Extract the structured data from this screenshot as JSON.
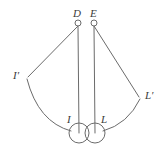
{
  "figure": {
    "type": "geometry-diagram",
    "background_color": "#ffffff",
    "stroke_color": "#6b6b6b",
    "label_color": "#3a3a3a",
    "stroke_width": 1,
    "width": 168,
    "height": 147,
    "labels": {
      "top_left": "D",
      "top_right": "E",
      "far_left": "I′",
      "far_right": "L′",
      "bottom_left": "I",
      "bottom_right": "L"
    },
    "nodes": [
      {
        "id": "D",
        "label": "D",
        "x": 78,
        "y": 23,
        "radius": 3,
        "kind": "open-circle"
      },
      {
        "id": "E",
        "label": "E",
        "x": 94,
        "y": 23,
        "radius": 3,
        "kind": "open-circle"
      },
      {
        "id": "I",
        "label": "I",
        "x": 79,
        "y": 133,
        "radius": 10,
        "kind": "open-circle"
      },
      {
        "id": "L",
        "label": "L",
        "x": 95,
        "y": 133,
        "radius": 10,
        "kind": "open-circle"
      },
      {
        "id": "Iprime",
        "label": "I′",
        "x": 27,
        "y": 78,
        "radius": 0,
        "kind": "vertex"
      },
      {
        "id": "Lprime",
        "label": "L′",
        "x": 140,
        "y": 98,
        "radius": 0,
        "kind": "vertex"
      }
    ],
    "segments": [
      {
        "id": "D-to-Iprime",
        "from": "D",
        "to": "Iprime"
      },
      {
        "id": "E-to-Lprime",
        "from": "E",
        "to": "Lprime"
      },
      {
        "id": "D-to-I",
        "from": "D",
        "to": "I"
      },
      {
        "id": "E-to-L",
        "from": "E",
        "to": "L"
      }
    ],
    "arcs": [
      {
        "id": "arc-Iprime-to-I",
        "from": "Iprime",
        "to": "I",
        "curvature": "convex-outward"
      },
      {
        "id": "arc-L-to-Lprime",
        "from": "L",
        "to": "Lprime",
        "curvature": "convex-outward"
      }
    ]
  }
}
